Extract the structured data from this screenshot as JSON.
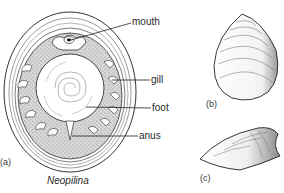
{
  "figure": {
    "title": "Neopilina",
    "panels": [
      {
        "id": "a",
        "caption": "(a)",
        "view": "ventral view of whole animal"
      },
      {
        "id": "b",
        "caption": "(b)",
        "view": "shell, dorsal view"
      },
      {
        "id": "c",
        "caption": "(c)",
        "view": "shell, lateral view"
      }
    ],
    "labels": {
      "mouth": "mouth",
      "gill": "gill",
      "foot": "foot",
      "anus": "anus"
    },
    "caption_a": "(a)",
    "caption_b": "(b)",
    "caption_c": "(c)"
  }
}
